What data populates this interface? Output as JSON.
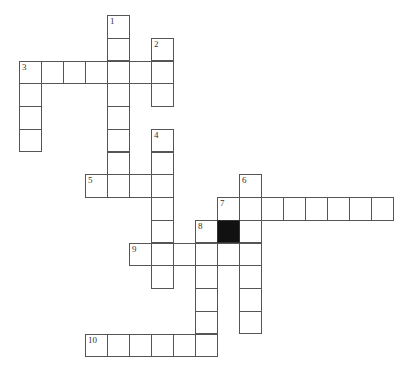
{
  "puzzle": {
    "type": "crossword",
    "grid": {
      "origin_x": 19,
      "origin_y": 15,
      "cell_w": 22,
      "cell_h": 22.75
    },
    "words": [
      {
        "number": "1",
        "direction": "down",
        "row": 0,
        "col": 4,
        "length": 8
      },
      {
        "number": "2",
        "direction": "down",
        "row": 1,
        "col": 6,
        "length": 3
      },
      {
        "number": "3",
        "direction": "across",
        "row": 2,
        "col": 0,
        "length": 7
      },
      {
        "number": "3",
        "direction": "down",
        "row": 2,
        "col": 0,
        "length": 4
      },
      {
        "number": "4",
        "direction": "down",
        "row": 5,
        "col": 6,
        "length": 7
      },
      {
        "number": "5",
        "direction": "across",
        "row": 7,
        "col": 3,
        "length": 4
      },
      {
        "number": "6",
        "direction": "down",
        "row": 7,
        "col": 10,
        "length": 7
      },
      {
        "number": "7",
        "direction": "across",
        "row": 8,
        "col": 9,
        "length": 8
      },
      {
        "number": "8",
        "direction": "down",
        "row": 9,
        "col": 8,
        "length": 6
      },
      {
        "number": "9",
        "direction": "across",
        "row": 10,
        "col": 5,
        "length": 6
      },
      {
        "number": "10",
        "direction": "across",
        "row": 14,
        "col": 3,
        "length": 6
      }
    ],
    "black_cells": [
      {
        "row": 9,
        "col": 9
      }
    ],
    "colors": {
      "border": "#555555",
      "black": "#111111",
      "background": "#ffffff"
    }
  }
}
